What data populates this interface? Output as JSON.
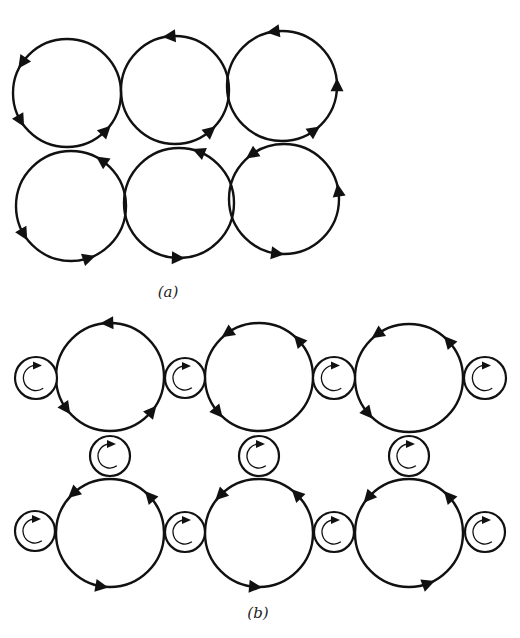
{
  "figure": {
    "stroke_color": "#111111",
    "background": "#ffffff",
    "panels": [
      {
        "id": "a",
        "label": "(a)",
        "label_pos": [
          168,
          292
        ],
        "description": "Six touching vortices in a 3x2 array, all rotating in the same sense",
        "large_radius": 54,
        "vortices": [
          {
            "cx": 67,
            "cy": 93,
            "r": 54,
            "sense": "ccw",
            "arrows_deg": [
              215,
              150,
              45
            ]
          },
          {
            "cx": 175,
            "cy": 90,
            "r": 54,
            "sense": "ccw",
            "arrows_deg": [
              265,
              50
            ]
          },
          {
            "cx": 282,
            "cy": 86,
            "r": 55,
            "sense": "ccw",
            "arrows_deg": [
              262,
              0,
              55
            ]
          },
          {
            "cx": 71,
            "cy": 206,
            "r": 55,
            "sense": "ccw",
            "arrows_deg": [
              305,
              150,
              72
            ]
          },
          {
            "cx": 179,
            "cy": 203,
            "r": 55,
            "sense": "ccw",
            "arrows_deg": [
              292,
              92
            ]
          },
          {
            "cx": 284,
            "cy": 199,
            "r": 55,
            "sense": "ccw",
            "arrows_deg": [
              235,
              352,
              98
            ]
          }
        ]
      },
      {
        "id": "b",
        "label": "(b)",
        "label_pos": [
          258,
          613
        ],
        "description": "Large vortices separated by small idle-wheel vortices rotating in the opposite sense",
        "large_vortices": [
          {
            "cx": 110,
            "cy": 377,
            "r": 54,
            "sense": "ccw",
            "arrows_deg": [
              268,
              145,
              40
            ]
          },
          {
            "cx": 259,
            "cy": 377,
            "r": 54,
            "sense": "ccw",
            "arrows_deg": [
              235,
              318,
              140
            ]
          },
          {
            "cx": 409,
            "cy": 378,
            "r": 54,
            "sense": "ccw",
            "arrows_deg": [
              235,
              318,
              140
            ]
          },
          {
            "cx": 110,
            "cy": 533,
            "r": 54,
            "sense": "ccw",
            "arrows_deg": [
              228,
              318,
              100
            ]
          },
          {
            "cx": 259,
            "cy": 533,
            "r": 54,
            "sense": "ccw",
            "arrows_deg": [
              225,
              315,
              95
            ]
          },
          {
            "cx": 409,
            "cy": 533,
            "r": 54,
            "sense": "ccw",
            "arrows_deg": [
              222,
              318,
              70
            ]
          }
        ],
        "small_vortices": [
          {
            "cx": 36,
            "cy": 378,
            "r": 21,
            "sense": "cw"
          },
          {
            "cx": 185,
            "cy": 378,
            "r": 20,
            "sense": "cw"
          },
          {
            "cx": 334,
            "cy": 378,
            "r": 21,
            "sense": "cw"
          },
          {
            "cx": 485,
            "cy": 378,
            "r": 21,
            "sense": "cw"
          },
          {
            "cx": 110,
            "cy": 456,
            "r": 20,
            "sense": "cw"
          },
          {
            "cx": 259,
            "cy": 456,
            "r": 20,
            "sense": "cw"
          },
          {
            "cx": 409,
            "cy": 456,
            "r": 20,
            "sense": "cw"
          },
          {
            "cx": 35,
            "cy": 531,
            "r": 20,
            "sense": "cw"
          },
          {
            "cx": 185,
            "cy": 532,
            "r": 20,
            "sense": "cw"
          },
          {
            "cx": 334,
            "cy": 532,
            "r": 20,
            "sense": "cw"
          },
          {
            "cx": 485,
            "cy": 532,
            "r": 20,
            "sense": "cw"
          }
        ]
      }
    ]
  }
}
